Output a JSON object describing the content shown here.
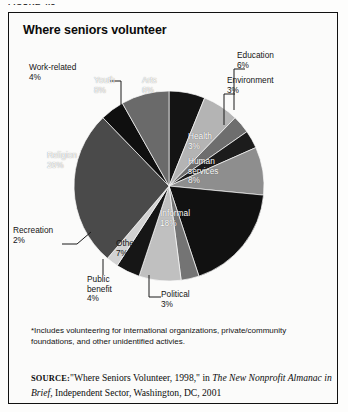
{
  "figure": {
    "caption": "FIGURE 4.5",
    "title": "Where seniors volunteer"
  },
  "footnote": "*Includes volunteering for international organizations, private/community foundations, and other unidentified activies.",
  "source": {
    "label": "SOURCE:",
    "part1": "\"Where Seniors Volunteer, 1998,\" in ",
    "italic1": "The New Nonprofit Almanac in Brief,",
    "part2": " Independent Sector, Washington, DC, 2001"
  },
  "chart_data": {
    "type": "pie",
    "title": "Where seniors volunteer",
    "unit": "percent",
    "start_angle_deg": -90,
    "direction": "clockwise",
    "categories": [
      "Arts",
      "Education",
      "Environment",
      "Health",
      "Human services",
      "Informal",
      "Political",
      "Other*",
      "Public benefit",
      "Recreation",
      "Religion",
      "Work-related",
      "Youth"
    ],
    "values": [
      6,
      6,
      3,
      3,
      8,
      18,
      3,
      7,
      4,
      2,
      26,
      4,
      8
    ],
    "slices": [
      {
        "label": "Arts",
        "pct": 6,
        "pct_text": "6%",
        "color": "#141414",
        "label_pos": "inside",
        "label_color": "#ffffff"
      },
      {
        "label": "Education",
        "pct": 6,
        "pct_text": "6%",
        "color": "#b4b4b4",
        "label_pos": "outside-leader"
      },
      {
        "label": "Environment",
        "pct": 3,
        "pct_text": "3%",
        "color": "#6e6e6e",
        "label_pos": "outside-leader"
      },
      {
        "label": "Health",
        "pct": 3,
        "pct_text": "3%",
        "color": "#1c1c1c",
        "label_pos": "inside",
        "label_color": "#ffffff"
      },
      {
        "label": "Human services",
        "pct": 8,
        "pct_text": "8%",
        "color": "#8e8e8e",
        "label_pos": "inside",
        "label_color": "#ffffff"
      },
      {
        "label": "Informal",
        "pct": 18,
        "pct_text": "18%",
        "color": "#111111",
        "label_pos": "inside",
        "label_color": "#ffffff"
      },
      {
        "label": "Political",
        "pct": 3,
        "pct_text": "3%",
        "color": "#747474",
        "label_pos": "outside-leader"
      },
      {
        "label": "Other*",
        "pct": 7,
        "pct_text": "7%",
        "color": "#c0c0c0",
        "label_pos": "inside",
        "label_color": "#151515"
      },
      {
        "label": "Public benefit",
        "pct": 4,
        "pct_text": "4%",
        "color": "#161616",
        "label_pos": "outside-leader"
      },
      {
        "label": "Recreation",
        "pct": 2,
        "pct_text": "2%",
        "color": "#d2d2d2",
        "label_pos": "outside-leader"
      },
      {
        "label": "Religion",
        "pct": 26,
        "pct_text": "26%",
        "color": "#4a4a4a",
        "label_pos": "inside",
        "label_color": "#ffffff"
      },
      {
        "label": "Work-related",
        "pct": 4,
        "pct_text": "4%",
        "color": "#0f0f0f",
        "label_pos": "outside-leader"
      },
      {
        "label": "Youth",
        "pct": 8,
        "pct_text": "8%",
        "color": "#6a6a6a",
        "label_pos": "inside",
        "label_color": "#ffffff"
      }
    ]
  },
  "labels": {
    "arts": {
      "name": "Arts",
      "pct": "6%"
    },
    "education": {
      "name": "Education",
      "pct": "6%"
    },
    "environment": {
      "name": "Environment",
      "pct": "3%"
    },
    "health": {
      "name": "Health",
      "pct": "3%"
    },
    "human_services": {
      "name": "Human",
      "name2": "services",
      "pct": "8%"
    },
    "informal": {
      "name": "Informal",
      "pct": "18%"
    },
    "political": {
      "name": "Political",
      "pct": "3%"
    },
    "other": {
      "name": "Other*",
      "pct": "7%"
    },
    "public_benefit": {
      "name": "Public",
      "name2": "benefit",
      "pct": "4%"
    },
    "recreation": {
      "name": "Recreation",
      "pct": "2%"
    },
    "religion": {
      "name": "Religion",
      "pct": "26%"
    },
    "work_related": {
      "name": "Work-related",
      "pct": "4%"
    },
    "youth": {
      "name": "Youth",
      "pct": "8%"
    }
  }
}
